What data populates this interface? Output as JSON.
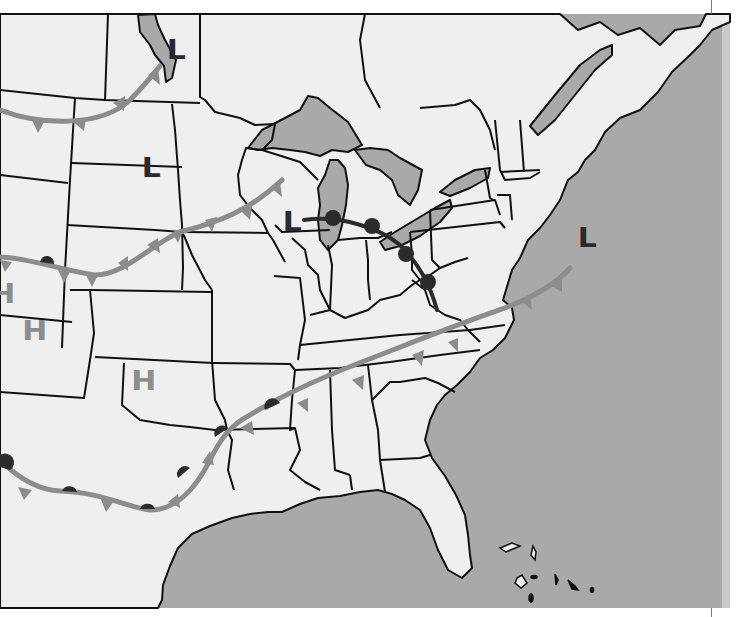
{
  "map": {
    "title": "Weather map of the United States",
    "colors": {
      "ocean": "#a9a9a9",
      "land": "#efefef",
      "lakes": "#a9a9a9",
      "borders": "#111111",
      "cold_front": "#8c8c8c",
      "stationary_front": "#8c8c8c",
      "warm_front_symbols": "#2b2b2b",
      "low_label": "#2a2a2a",
      "high_label": "#8c8c8c"
    },
    "pressure_centers": [
      {
        "type": "low",
        "label": "L",
        "location": "northern Minnesota / Lake of the Woods",
        "x": 168,
        "y": 37
      },
      {
        "type": "low",
        "label": "L",
        "location": "South Dakota",
        "x": 143,
        "y": 155
      },
      {
        "type": "low",
        "label": "L",
        "location": "Wisconsin / Iowa",
        "x": 284,
        "y": 209
      },
      {
        "type": "low",
        "label": "L",
        "location": "off New England coast",
        "x": 579,
        "y": 225
      },
      {
        "type": "high",
        "label": "H",
        "location": "Wyoming / Idaho edge",
        "x": 0,
        "y": 281
      },
      {
        "type": "high",
        "label": "H",
        "location": "Colorado",
        "x": 24,
        "y": 318
      },
      {
        "type": "high",
        "label": "H",
        "location": "Oklahoma panhandle",
        "x": 133,
        "y": 368
      }
    ],
    "fronts": [
      {
        "type": "cold",
        "name": "northern-cold-front",
        "location": "Montana to Manitoba"
      },
      {
        "type": "cold-stationary",
        "name": "central-front",
        "location": "Wyoming through Nebraska to Wisconsin"
      },
      {
        "type": "warm",
        "name": "great-lakes-warm-front",
        "location": "Lake Michigan to Ohio"
      },
      {
        "type": "stationary",
        "name": "southern-front",
        "location": "Arizona through Texas to Virginia coast"
      }
    ]
  }
}
